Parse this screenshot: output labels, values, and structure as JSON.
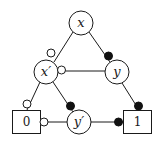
{
  "diagram": {
    "type": "binary-decision-diagram",
    "nodes": [
      {
        "id": "x",
        "label": "x",
        "shape": "circle",
        "cx": 81,
        "cy": 23
      },
      {
        "id": "xp",
        "label": "x′",
        "shape": "circle",
        "cx": 46,
        "cy": 72
      },
      {
        "id": "y",
        "label": "y",
        "shape": "circle",
        "cx": 117,
        "cy": 72
      },
      {
        "id": "yp",
        "label": "y′",
        "shape": "circle",
        "cx": 79,
        "cy": 122
      }
    ],
    "terminals": [
      {
        "id": "t0",
        "label": "0",
        "shape": "box"
      },
      {
        "id": "t1",
        "label": "1",
        "shape": "box"
      }
    ],
    "edges": [
      {
        "from": "x",
        "to": "xp",
        "marker": "hollow"
      },
      {
        "from": "x",
        "to": "y",
        "marker": "filled"
      },
      {
        "from": "y",
        "to": "xp",
        "marker": "hollow"
      },
      {
        "from": "xp",
        "to": "t0",
        "marker": "hollow"
      },
      {
        "from": "xp",
        "to": "yp",
        "marker": "filled"
      },
      {
        "from": "y",
        "to": "t1",
        "marker": "filled"
      },
      {
        "from": "yp",
        "to": "t0",
        "marker": "hollow"
      },
      {
        "from": "yp",
        "to": "t1",
        "marker": "filled"
      }
    ],
    "legend_semantics": {
      "hollow": "low (0) branch",
      "filled": "high (1) branch"
    }
  }
}
